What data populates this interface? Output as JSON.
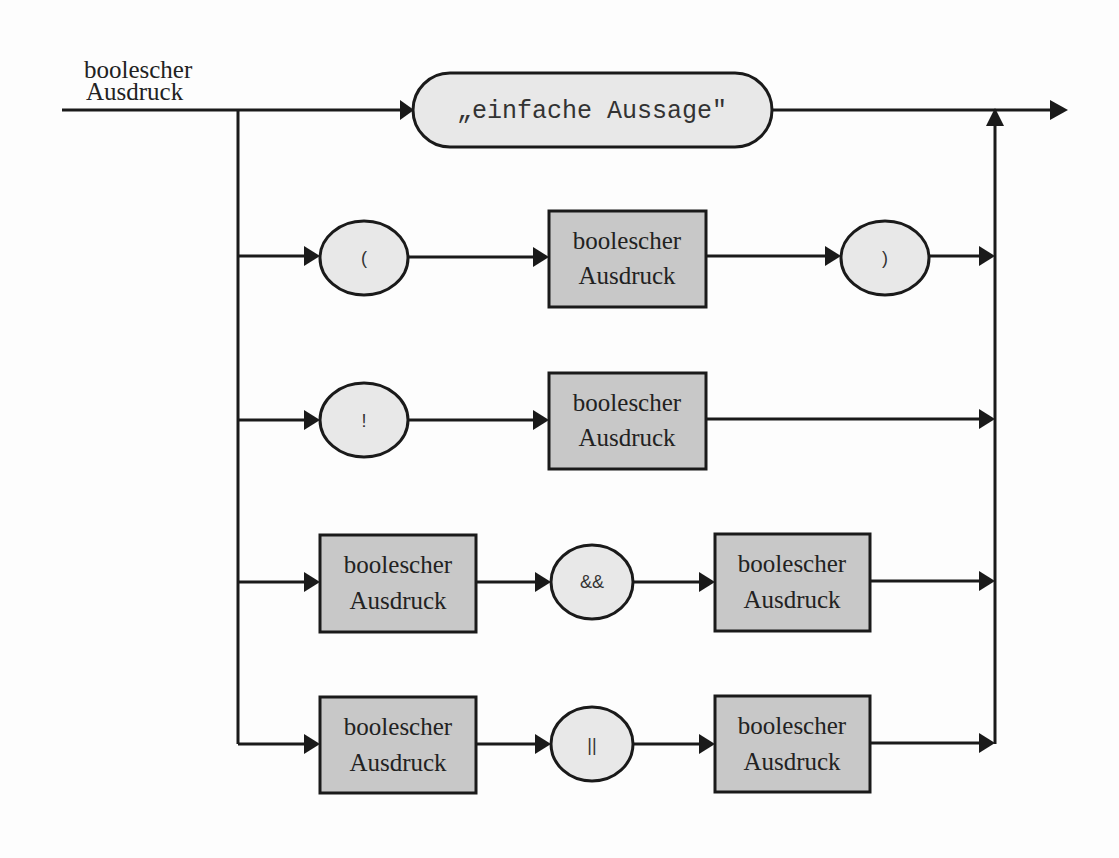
{
  "diagram": {
    "type": "syntax-diagram",
    "entry_label": {
      "line1": "boolescher",
      "line2": "Ausdruck"
    },
    "branches": [
      {
        "id": "simple",
        "elements": [
          {
            "kind": "terminal",
            "text": "„einfache Aussage\""
          }
        ]
      },
      {
        "id": "parenthesized",
        "elements": [
          {
            "kind": "terminal",
            "text": "("
          },
          {
            "kind": "nonterminal",
            "line1": "boolescher",
            "line2": "Ausdruck"
          },
          {
            "kind": "terminal",
            "text": ")"
          }
        ]
      },
      {
        "id": "negation",
        "elements": [
          {
            "kind": "terminal",
            "text": "!"
          },
          {
            "kind": "nonterminal",
            "line1": "boolescher",
            "line2": "Ausdruck"
          }
        ]
      },
      {
        "id": "and",
        "elements": [
          {
            "kind": "nonterminal",
            "line1": "boolescher",
            "line2": "Ausdruck"
          },
          {
            "kind": "terminal",
            "text": "&&"
          },
          {
            "kind": "nonterminal",
            "line1": "boolescher",
            "line2": "Ausdruck"
          }
        ]
      },
      {
        "id": "or",
        "elements": [
          {
            "kind": "nonterminal",
            "line1": "boolescher",
            "line2": "Ausdruck"
          },
          {
            "kind": "terminal",
            "text": "||"
          },
          {
            "kind": "nonterminal",
            "line1": "boolescher",
            "line2": "Ausdruck"
          }
        ]
      }
    ],
    "colors": {
      "line": "#1a1a1a",
      "nonterminal_fill": "#c8c8c8",
      "terminal_fill": "#e8e8e8"
    }
  }
}
